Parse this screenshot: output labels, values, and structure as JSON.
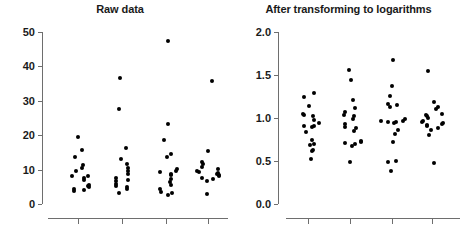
{
  "figure": {
    "background": "#ffffff",
    "dot_color": "#000000",
    "axis_color": "#6e6e6e",
    "text_color": "#1a1a1a"
  },
  "panels": [
    {
      "id": "raw",
      "title": "Raw data"
    },
    {
      "id": "log",
      "title": "After transforming to logarithms"
    }
  ],
  "chart_data": [
    {
      "type": "scatter",
      "title": "Raw data",
      "xlabel": "",
      "ylabel": "",
      "ylim": [
        0,
        50
      ],
      "yticks": [
        0,
        10,
        20,
        30,
        40,
        50
      ],
      "ytick_labels": [
        "0",
        "10",
        "20",
        "30",
        "40",
        "50"
      ],
      "xticks": [
        1,
        2,
        3,
        4
      ],
      "xtick_labels": [
        "",
        "",
        "",
        ""
      ],
      "grid": false,
      "legend": "none",
      "note": "Four unlabeled groups of strip-plotted individual observations; strong right skew with high outliers in groups 2, 3 and 4.",
      "series": [
        {
          "name": "Group 1",
          "x": 1,
          "values": [
            19.5,
            15.6,
            13.8,
            11.3,
            10.4,
            9.6,
            8.2,
            8.1,
            7.6,
            6.9,
            5.6,
            5.3,
            4.9,
            4.5,
            4.2,
            3.7
          ]
        },
        {
          "name": "Group 2",
          "x": 2,
          "values": [
            36.6,
            27.5,
            16.4,
            13.1,
            11.7,
            10.5,
            9.7,
            8.6,
            7.5,
            7.1,
            6.6,
            5.7,
            5.3,
            5.0,
            4.3,
            3.2
          ]
        },
        {
          "name": "Group 3",
          "x": 3,
          "values": [
            47.5,
            23.3,
            18.5,
            14.5,
            13.7,
            10.1,
            9.6,
            9.2,
            8.8,
            8.3,
            7.3,
            6.4,
            5.6,
            4.4,
            3.4,
            3.2,
            2.5
          ]
        },
        {
          "name": "Group 4",
          "x": 4,
          "values": [
            35.8,
            15.5,
            12.1,
            11.5,
            10.9,
            10.2,
            9.7,
            9.3,
            9.0,
            8.8,
            8.4,
            8.0,
            7.5,
            7.3,
            6.8,
            3.0
          ]
        }
      ]
    },
    {
      "type": "scatter",
      "title": "After transforming to logarithms",
      "xlabel": "",
      "ylabel": "",
      "ylim": [
        0.0,
        2.0
      ],
      "yticks": [
        0.0,
        0.5,
        1.0,
        1.5,
        2.0
      ],
      "ytick_labels": [
        "0.0",
        "0.5",
        "1.0",
        "1.5",
        "2.0"
      ],
      "xticks": [
        1,
        2,
        3,
        4
      ],
      "xtick_labels": [
        "",
        "",
        "",
        ""
      ],
      "grid": false,
      "legend": "none",
      "note": "Same four groups after base-10 log transformation; distributions become approximately symmetric around 1.0.",
      "series": [
        {
          "name": "Group 1",
          "x": 1,
          "values": [
            1.29,
            1.24,
            1.14,
            1.05,
            1.03,
            1.02,
            0.98,
            0.94,
            0.91,
            0.91,
            0.89,
            0.84,
            0.75,
            0.7,
            0.69,
            0.63,
            0.62,
            0.52
          ]
        },
        {
          "name": "Group 2",
          "x": 2,
          "values": [
            1.56,
            1.44,
            1.21,
            1.12,
            1.07,
            1.04,
            1.02,
            0.99,
            0.93,
            0.9,
            0.88,
            0.85,
            0.73,
            0.72,
            0.71,
            0.7,
            0.67,
            0.49
          ]
        },
        {
          "name": "Group 3",
          "x": 3,
          "values": [
            1.67,
            1.37,
            1.26,
            1.16,
            1.15,
            1.13,
            0.99,
            0.97,
            0.96,
            0.95,
            0.95,
            0.94,
            0.86,
            0.81,
            0.72,
            0.5,
            0.49,
            0.38
          ]
        },
        {
          "name": "Group 4",
          "x": 4,
          "values": [
            1.55,
            1.19,
            1.13,
            1.1,
            1.05,
            1.03,
            1.02,
            1.0,
            0.97,
            0.95,
            0.94,
            0.93,
            0.92,
            0.91,
            0.88,
            0.86,
            0.8,
            0.48
          ]
        }
      ]
    }
  ]
}
